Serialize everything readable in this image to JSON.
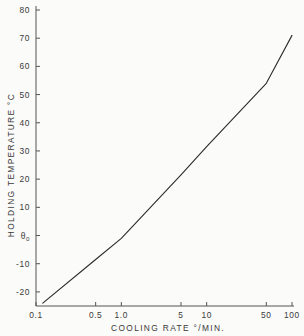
{
  "chart_data": {
    "type": "line",
    "title": "",
    "xlabel": "COOLING RATE °/MIN.",
    "ylabel": "HOLDING TEMPERATURE °C",
    "xscale": "log",
    "yscale": "linear",
    "xlim": [
      0.1,
      100
    ],
    "ylim": [
      -25,
      80
    ],
    "grid": false,
    "legend": null,
    "xticks": [
      {
        "value": 0.1,
        "label": "0.1"
      },
      {
        "value": 0.5,
        "label": "0.5"
      },
      {
        "value": 1.0,
        "label": "1.0"
      },
      {
        "value": 5,
        "label": "5"
      },
      {
        "value": 10,
        "label": "10"
      },
      {
        "value": 50,
        "label": "50"
      },
      {
        "value": 100,
        "label": "100"
      }
    ],
    "yticks": [
      {
        "value": 80,
        "label": "80"
      },
      {
        "value": 70,
        "label": "70"
      },
      {
        "value": 60,
        "label": "60"
      },
      {
        "value": 50,
        "label": "50"
      },
      {
        "value": 40,
        "label": "40"
      },
      {
        "value": 30,
        "label": "30"
      },
      {
        "value": 20,
        "label": "20"
      },
      {
        "value": 10,
        "label": "10"
      },
      {
        "value": 0,
        "label": "θ",
        "sub": "0"
      },
      {
        "value": -10,
        "label": "-10"
      },
      {
        "value": -20,
        "label": "-20"
      }
    ],
    "series": [
      {
        "name": "holding temperature vs cooling rate",
        "x": [
          0.12,
          0.5,
          1.0,
          5,
          10,
          50,
          100
        ],
        "y": [
          -24.0,
          -8.5,
          -1.0,
          21.5,
          31.5,
          54.0,
          71.0
        ],
        "color": "#2b2b2b",
        "linewidth": 1.1,
        "style": "solid",
        "markers": "none"
      }
    ],
    "annotations": [
      {
        "text": "θ0",
        "meaning": "zero reference temperature marked on y-axis"
      }
    ]
  },
  "style": {
    "background": "#fbfbf9",
    "axis_color": "#555555",
    "text_color": "#3a3a3a",
    "line_color": "#2b2b2b"
  }
}
